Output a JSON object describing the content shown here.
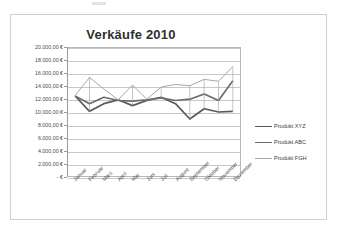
{
  "chart_data": {
    "type": "line",
    "title": "Verkäufe 2010",
    "xlabel": "",
    "ylabel": "",
    "categories": [
      "Januar",
      "Februar",
      "März",
      "April",
      "Mai",
      "Juni",
      "Juli",
      "August",
      "September",
      "Oktober",
      "November",
      "Dezember"
    ],
    "series": [
      {
        "name": "Produkt XYZ",
        "color": "#595959",
        "values": [
          12500,
          10100,
          11300,
          11900,
          11000,
          11800,
          12300,
          11300,
          8900,
          10500,
          10000,
          10100
        ]
      },
      {
        "name": "Produkt ABC",
        "color": "#6b6b6b",
        "values": [
          12500,
          11300,
          12300,
          11800,
          11700,
          11900,
          12200,
          11800,
          12000,
          12800,
          11800,
          14900
        ]
      },
      {
        "name": "Produkt FGH",
        "color": "#a6a6a6",
        "values": [
          12600,
          15400,
          13600,
          11900,
          14200,
          12000,
          13900,
          14300,
          14100,
          15100,
          14800,
          17100
        ]
      }
    ],
    "ylim": [
      0,
      20000
    ],
    "ytick_values": [
      20000,
      18000,
      16000,
      14000,
      12000,
      10000,
      8000,
      6000,
      4000,
      2000,
      0
    ],
    "ytick_labels": [
      "20.000,00 €",
      "18.000,00 €",
      "16.000,00 €",
      "14.000,00 €",
      "12.000,00 €",
      "10.000,00 €",
      "8.000,00 €",
      "6.000,00 €",
      "4.000,00 €",
      "2.000,00 €",
      "-   €"
    ],
    "grid": true,
    "legend_position": "right",
    "markers": false
  },
  "legend": {
    "entries": [
      {
        "label": "Produkt XYZ",
        "color": "#595959",
        "width": 1.9
      },
      {
        "label": "Produkt ABC",
        "color": "#6b6b6b",
        "width": 1.9
      },
      {
        "label": "Produkt FGH",
        "color": "#a6a6a6",
        "width": 1.1
      }
    ]
  },
  "frame": {
    "border_color": "#cfcfcf",
    "background": "#ffffff"
  }
}
